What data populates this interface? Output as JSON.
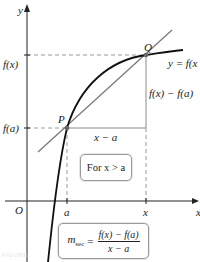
{
  "diagram": {
    "axes": {
      "x_label": "x",
      "y_label": "y",
      "origin_label": "O"
    },
    "y_ticks": [
      {
        "label": "f(x)",
        "y": 55
      },
      {
        "label": "f(a)",
        "y": 128
      }
    ],
    "x_ticks": [
      {
        "label": "a",
        "x": 67
      },
      {
        "label": "x",
        "x": 146
      }
    ],
    "points": [
      {
        "label": "P",
        "x": 67,
        "y": 128
      },
      {
        "label": "Q",
        "x": 146,
        "y": 55
      }
    ],
    "curve_label": "y = f(x",
    "rise_label": "f(x) − f(a)",
    "run_label": "x − a",
    "condition_box": "For x > a",
    "formula": {
      "lhs": "m",
      "lhs_sub": "sec",
      "equals": "=",
      "numerator": "f(x) − f(a)",
      "denominator": "x − a"
    },
    "caption": "FIGURE",
    "colors": {
      "curve": "#111111",
      "secant": "#7a7a7a",
      "axes": "#222222",
      "dashed": "#9a9a9a",
      "point": "#666666",
      "box_border": "#9a9a9a"
    }
  }
}
